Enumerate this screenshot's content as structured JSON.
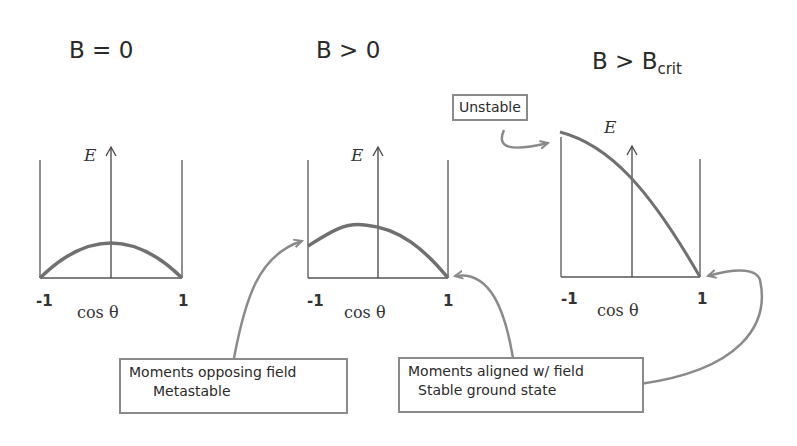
{
  "panels": [
    {
      "title": "B = 0",
      "title_sub": "",
      "y_label": "E",
      "x_label": "cos θ",
      "x_ticks": [
        "-1",
        "1"
      ],
      "curve": "symmetric maximum at cos θ = 0"
    },
    {
      "title": "B > 0",
      "title_sub": "",
      "y_label": "E",
      "x_label": "cos θ",
      "x_ticks": [
        "-1",
        "1"
      ],
      "curve": "maximum shifted toward cos θ < 0; left end elevated"
    },
    {
      "title": "B > B",
      "title_sub": "crit",
      "y_label": "E",
      "x_label": "cos θ",
      "x_ticks": [
        "-1",
        "1"
      ],
      "curve": "monotonically decreasing from cos θ = -1 to 1"
    }
  ],
  "annotations": {
    "unstable": "Unstable",
    "opposing_line1": "Moments opposing field",
    "opposing_line2": "Metastable",
    "aligned_line1": "Moments aligned w/ field",
    "aligned_line2": "Stable ground state"
  },
  "colors": {
    "curve": "#707070",
    "axis": "#444444",
    "arrow": "#8a8a8a"
  }
}
